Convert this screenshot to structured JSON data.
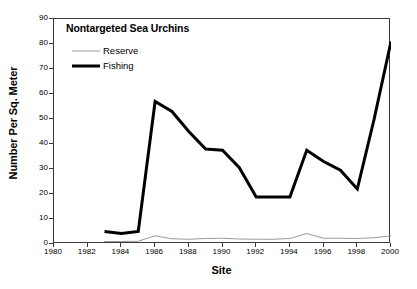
{
  "chart_data": {
    "type": "line",
    "title": "Nontargeted Sea Urchins",
    "xlabel": "Site",
    "ylabel": "Number Per Sq. Meter",
    "xlim": [
      1980,
      2000
    ],
    "ylim": [
      0,
      90
    ],
    "ytick_step": 10,
    "xtick_step": 2,
    "grid": false,
    "legend_position": "top-left inside plot",
    "xticks": [
      "1980",
      "1982",
      "1984",
      "1986",
      "1988",
      "1990",
      "1992",
      "1994",
      "1996",
      "1998",
      "2000"
    ],
    "yticks": [
      "0",
      "10",
      "20",
      "30",
      "40",
      "50",
      "60",
      "70",
      "80",
      "90"
    ],
    "series": [
      {
        "name": "Reserve",
        "color": "#9a9a9a",
        "width": 1,
        "x": [
          1983,
          1984,
          1985,
          1986,
          1987,
          1988,
          1989,
          1990,
          1991,
          1992,
          1993,
          1994,
          1995,
          1996,
          1997,
          1998,
          1999,
          2000
        ],
        "values": [
          1.0,
          1.0,
          1.1,
          3.3,
          2.1,
          1.9,
          2.2,
          2.3,
          2.0,
          1.9,
          1.9,
          2.2,
          4.2,
          2.3,
          2.3,
          2.2,
          2.5,
          3.3
        ]
      },
      {
        "name": "Fishing",
        "color": "#000000",
        "width": 3,
        "x": [
          1983,
          1984,
          1985,
          1986,
          1987,
          1988,
          1989,
          1990,
          1991,
          1992,
          1993,
          1994,
          1995,
          1996,
          1997,
          1998,
          1999,
          2000
        ],
        "values": [
          5.0,
          4.2,
          5.0,
          57.0,
          53.0,
          45.0,
          38.0,
          37.5,
          30.5,
          18.8,
          18.8,
          18.8,
          37.5,
          33.0,
          29.5,
          22.0,
          50.0,
          81.0
        ]
      }
    ]
  }
}
